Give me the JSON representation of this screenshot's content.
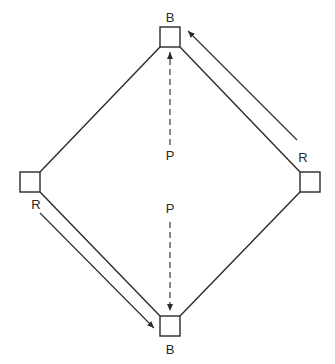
{
  "diagram": {
    "type": "baseball-diamond-play",
    "colors": {
      "stroke": "#2a2a2a",
      "background": "#ffffff"
    },
    "bases": [
      {
        "id": "top",
        "label": "B",
        "x": 160,
        "y": 27,
        "size": 20,
        "label_x": 170,
        "label_y": 22
      },
      {
        "id": "left",
        "label": "R",
        "x": 20,
        "y": 172,
        "size": 20,
        "label_x": 36,
        "label_y": 209
      },
      {
        "id": "right",
        "label": "R",
        "x": 300,
        "y": 172,
        "size": 20,
        "label_x": 303,
        "label_y": 162
      },
      {
        "id": "bottom",
        "label": "B",
        "x": 160,
        "y": 316,
        "size": 20,
        "label_x": 170,
        "label_y": 354
      }
    ],
    "pitcher_labels": [
      {
        "id": "p-top",
        "label": "P",
        "x": 170,
        "y": 160
      },
      {
        "id": "p-bottom",
        "label": "P",
        "x": 170,
        "y": 213
      }
    ],
    "arrows": [
      {
        "id": "dashed-up",
        "style": "dashed",
        "from": [
          170,
          145
        ],
        "to": [
          170,
          52
        ]
      },
      {
        "id": "dashed-down",
        "style": "dashed",
        "from": [
          170,
          222
        ],
        "to": [
          170,
          311
        ]
      },
      {
        "id": "runner-right-to-top",
        "style": "solid",
        "from": [
          297,
          140
        ],
        "to": [
          188,
          31
        ]
      },
      {
        "id": "runner-left-to-bottom",
        "style": "solid",
        "from": [
          40,
          213
        ],
        "to": [
          154,
          328
        ]
      }
    ]
  }
}
